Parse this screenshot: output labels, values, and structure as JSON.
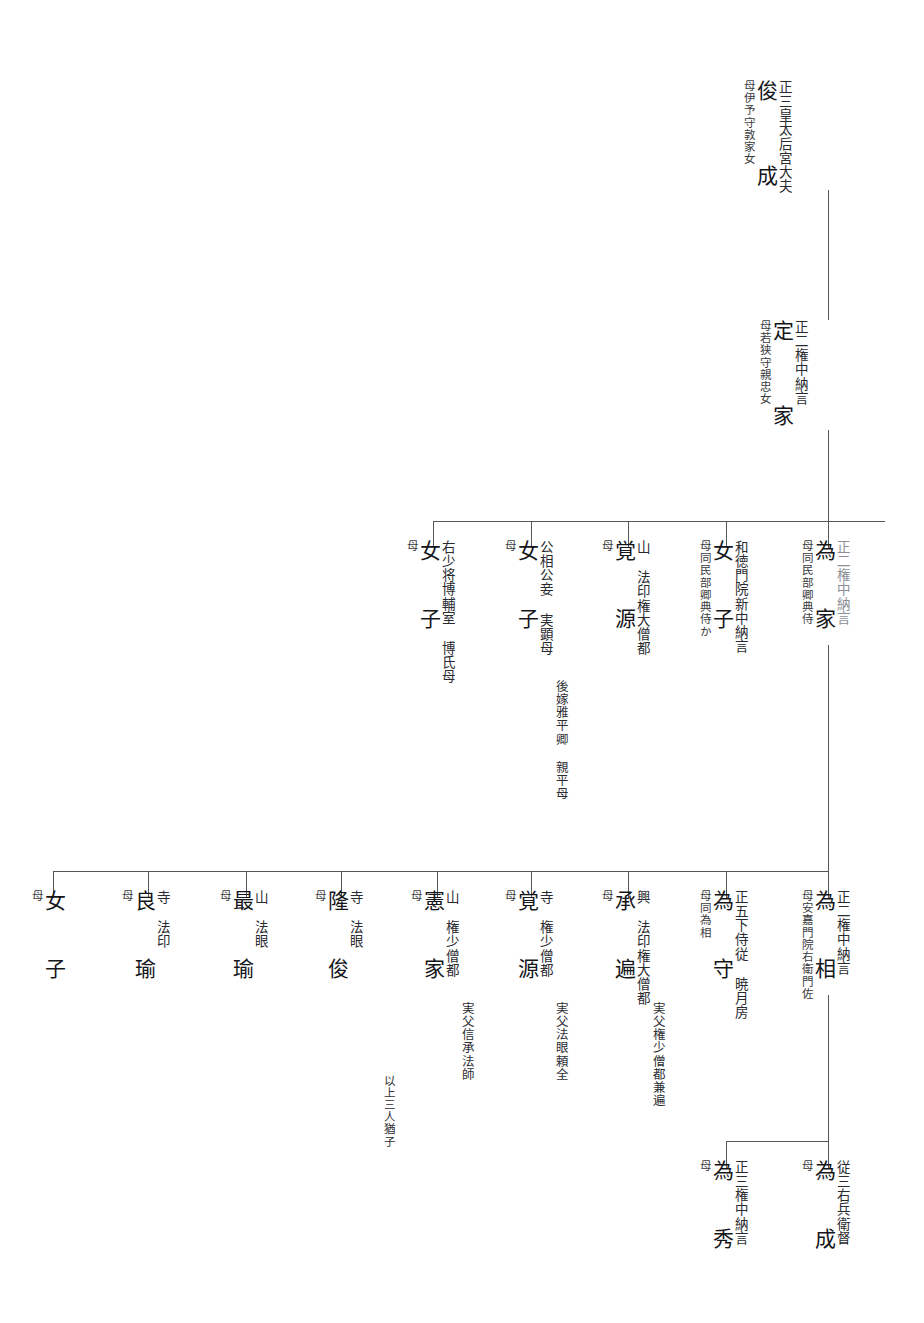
{
  "document": {
    "type": "genealogy-chart",
    "script": "japanese-vertical",
    "family": "Reizei / Mikohidari line (Fujiwara no Shunzei - Teika - Tameie)",
    "reading_direction": "right-to-left, top-to-bottom"
  },
  "generations": [
    {
      "level": 1,
      "nodes": [
        {
          "id": "shunzei",
          "name": "俊 成",
          "rank": "正三皇太后宮大夫",
          "mother": "母伊予守敦家女",
          "note": ""
        }
      ]
    },
    {
      "level": 2,
      "nodes": [
        {
          "id": "teika",
          "name": "定 家",
          "rank": "正二権中納言",
          "mother": "母若狭守親忠女",
          "note": ""
        }
      ]
    },
    {
      "level": 3,
      "nodes": [
        {
          "id": "tameie",
          "name": "為 家",
          "rank": "正二権中納言",
          "mother": "母同民部卿典侍",
          "note": ""
        },
        {
          "id": "joshi-1",
          "name": "女 子",
          "rank": "和徳門院新中納言",
          "mother": "母同民部卿典侍か",
          "note": ""
        },
        {
          "id": "kakugen-1",
          "name": "覚 源",
          "rank": "山  法印権大僧都",
          "mother": "母",
          "note": ""
        },
        {
          "id": "joshi-2",
          "name": "女 子",
          "rank": "公相公妾  実顕母",
          "mother": "母",
          "note": "後嫁雅平卿  親平母"
        },
        {
          "id": "joshi-3",
          "name": "女 子",
          "rank": "右少将博輔室  博氏母",
          "mother": "母",
          "note": ""
        }
      ]
    },
    {
      "level": 4,
      "nodes": [
        {
          "id": "tamesuke",
          "name": "為 相",
          "rank": "正二権中納言",
          "mother": "母安嘉門院右衛門佐",
          "note": ""
        },
        {
          "id": "tamemori",
          "name": "為 守",
          "rank": "正五下侍従  暁月房",
          "mother": "母同為相",
          "note": ""
        },
        {
          "id": "johen",
          "name": "承 遍",
          "rank": "興  法印権大僧都",
          "mother": "母",
          "note": "実父権少僧都兼遍"
        },
        {
          "id": "kakugen-2",
          "name": "覚 源",
          "rank": "寺  権少僧都",
          "mother": "母",
          "note": "実父法眼頼全"
        },
        {
          "id": "noriie",
          "name": "憲 家",
          "rank": "山  権少僧都",
          "mother": "母",
          "note": "実父信承法師",
          "note2": "以上三人猶子"
        },
        {
          "id": "ryushun",
          "name": "隆 俊",
          "rank": "寺  法眼",
          "mother": "母",
          "note": ""
        },
        {
          "id": "saiyu",
          "name": "最 瑜",
          "rank": "山  法眼",
          "mother": "母",
          "note": ""
        },
        {
          "id": "ryoyu",
          "name": "良 瑜",
          "rank": "寺  法印",
          "mother": "母",
          "note": ""
        },
        {
          "id": "joshi-4",
          "name": "女 子",
          "rank": "",
          "mother": "母",
          "note": ""
        }
      ]
    },
    {
      "level": 5,
      "nodes": [
        {
          "id": "tamenari",
          "name": "為 成",
          "rank": "従三右兵衛督",
          "mother": "母",
          "note": ""
        },
        {
          "id": "tamehide",
          "name": "為 秀",
          "rank": "正三権中納言",
          "mother": "母",
          "note": ""
        }
      ]
    }
  ],
  "colors": {
    "line": "#55565c",
    "text": "#15161a",
    "faded": "#8d8f96",
    "background": "#ffffff"
  }
}
